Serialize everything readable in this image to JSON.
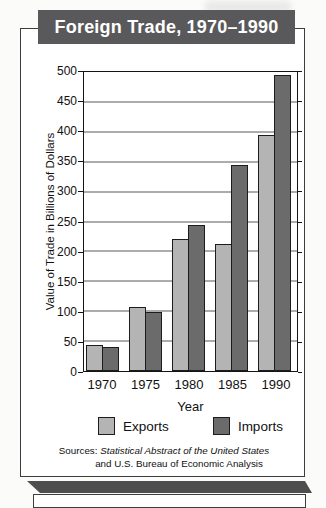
{
  "title": "Foreign Trade, 1970–1990",
  "chart_data": {
    "type": "bar",
    "title": "Foreign Trade, 1970–1990",
    "categories": [
      "1970",
      "1975",
      "1980",
      "1985",
      "1990"
    ],
    "series": [
      {
        "name": "Exports",
        "color": "#b4b4b4",
        "values": [
          43,
          107,
          220,
          213,
          394
        ]
      },
      {
        "name": "Imports",
        "color": "#6b6b6b",
        "values": [
          40,
          99,
          245,
          345,
          495
        ]
      }
    ],
    "xlabel": "Year",
    "ylabel": "Value of Trade in Billions of Dollars",
    "ylim": [
      0,
      500
    ],
    "yticks": [
      0,
      50,
      100,
      150,
      200,
      250,
      300,
      350,
      400,
      450,
      500
    ],
    "grid": true,
    "legend_position": "bottom-center"
  },
  "sources": {
    "prefix": "Sources: ",
    "italic_title": "Statistical Abstract of the United States",
    "line2": "and U.S. Bureau of Economic Analysis"
  },
  "colors": {
    "banner_bg": "#59595b",
    "banner_text": "#ffffff",
    "bar_border": "#1c1c1c",
    "grid_line": "#5a5a5a",
    "plot_border": "#141414",
    "box_border": "#3d3d3d",
    "band": "#4e4e4e",
    "text": "#111111",
    "page_bg": "#fbfbfa"
  }
}
